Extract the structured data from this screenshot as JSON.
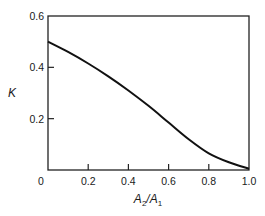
{
  "chart_data": {
    "type": "line",
    "title": "",
    "xlabel": "A2/A1",
    "xlabel_parts": {
      "a": "A",
      "sub1": "2",
      "slash": "/",
      "b": "A",
      "sub2": "1"
    },
    "ylabel": "K",
    "xlim": [
      0,
      1.0
    ],
    "ylim": [
      0,
      0.6
    ],
    "grid": false,
    "legend": null,
    "x_ticks": [
      0,
      0.2,
      0.4,
      0.6,
      0.8,
      1.0
    ],
    "x_tick_labels": [
      "0",
      "0.2",
      "0.4",
      "0.6",
      "0.8",
      "1.0"
    ],
    "y_ticks": [
      0.2,
      0.4,
      0.6
    ],
    "y_tick_labels": [
      "0.2",
      "0.4",
      "0.6"
    ],
    "series": [
      {
        "name": "K",
        "x": [
          0.0,
          0.1,
          0.2,
          0.3,
          0.4,
          0.5,
          0.6,
          0.7,
          0.8,
          0.9,
          1.0
        ],
        "values": [
          0.5,
          0.46,
          0.415,
          0.365,
          0.31,
          0.25,
          0.185,
          0.12,
          0.065,
          0.03,
          0.005
        ]
      }
    ],
    "colors": {
      "line": "#111111",
      "axis": "#222222"
    }
  }
}
